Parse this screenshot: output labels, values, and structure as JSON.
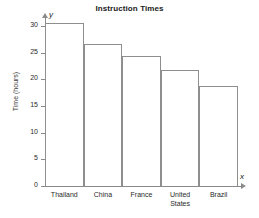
{
  "chart_data": {
    "type": "bar",
    "title": "Instruction Times",
    "xlabel": "x",
    "ylabel": "Time (hours)",
    "categories": [
      "Thailand",
      "China",
      "France",
      "United States",
      "Brazil"
    ],
    "values": [
      30.5,
      26.7,
      24.4,
      21.8,
      18.8
    ],
    "ylim": [
      0,
      30
    ],
    "yticks": [
      0,
      5,
      10,
      15,
      20,
      25,
      30
    ],
    "ytick_labels": [
      "0",
      "5",
      "10",
      "15",
      "20",
      "25",
      "30"
    ],
    "grid": false,
    "legend": null,
    "axis_arrow_labels": {
      "x": "x",
      "y": "y"
    },
    "bar_style": {
      "fill": "#ffffff",
      "stroke": "#8e8e8e"
    }
  },
  "category_lines": [
    [
      "Thailand"
    ],
    [
      "China"
    ],
    [
      "France"
    ],
    [
      "United",
      "States"
    ],
    [
      "Brazil"
    ]
  ]
}
